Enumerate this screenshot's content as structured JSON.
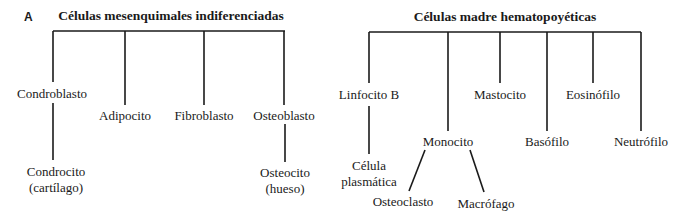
{
  "panel_label": "A",
  "left_tree": {
    "root": "Células mesenquimales indiferenciadas",
    "children": [
      {
        "label": "Condroblasto",
        "child": [
          "Condrocito",
          "(cartílago)"
        ]
      },
      {
        "label": "Adipocito"
      },
      {
        "label": "Fibroblasto"
      },
      {
        "label": "Osteoblasto",
        "child": [
          "Osteocito",
          "(hueso)"
        ]
      }
    ]
  },
  "right_tree": {
    "root": "Células madre hematopoyéticas",
    "children": [
      {
        "label": "Linfocito B",
        "child": [
          "Célula",
          "plasmática"
        ]
      },
      {
        "label": "Monocito",
        "children": [
          "Osteoclasto",
          "Macrófago"
        ]
      },
      {
        "label": "Mastocito"
      },
      {
        "label": "Basófilo"
      },
      {
        "label": "Eosinófilo"
      },
      {
        "label": "Neutrófilo"
      }
    ]
  },
  "colors": {
    "line": "#1a1a1a",
    "text": "#1a1a1a",
    "background": "#ffffff"
  }
}
